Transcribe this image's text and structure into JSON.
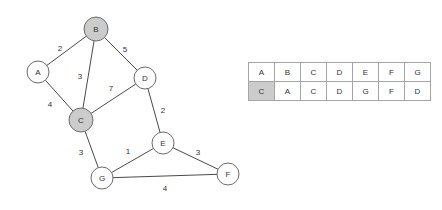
{
  "diagram": {
    "type": "weighted-undirected-graph",
    "nodes": [
      {
        "id": "A",
        "label": "A",
        "x": 38,
        "y": 72,
        "r": 11,
        "state": "plain"
      },
      {
        "id": "B",
        "label": "B",
        "x": 96,
        "y": 29,
        "r": 12,
        "state": "visited"
      },
      {
        "id": "C",
        "label": "C",
        "x": 81,
        "y": 120,
        "r": 12,
        "state": "visited"
      },
      {
        "id": "D",
        "label": "D",
        "x": 145,
        "y": 78,
        "r": 11,
        "state": "plain"
      },
      {
        "id": "E",
        "label": "E",
        "x": 163,
        "y": 143,
        "r": 11,
        "state": "plain"
      },
      {
        "id": "F",
        "label": "F",
        "x": 228,
        "y": 174,
        "r": 11,
        "state": "plain"
      },
      {
        "id": "G",
        "label": "G",
        "x": 102,
        "y": 178,
        "r": 11,
        "state": "plain"
      }
    ],
    "edges": [
      {
        "from": "A",
        "to": "B",
        "weight": "2",
        "lx": 60,
        "ly": 48
      },
      {
        "from": "B",
        "to": "D",
        "weight": "5",
        "lx": 125,
        "ly": 49
      },
      {
        "from": "B",
        "to": "C",
        "weight": "3",
        "lx": 80,
        "ly": 76
      },
      {
        "from": "A",
        "to": "C",
        "weight": "4",
        "lx": 50,
        "ly": 104
      },
      {
        "from": "C",
        "to": "D",
        "weight": "7",
        "lx": 111,
        "ly": 88
      },
      {
        "from": "D",
        "to": "E",
        "weight": "2",
        "lx": 163,
        "ly": 110
      },
      {
        "from": "C",
        "to": "G",
        "weight": "3",
        "lx": 81,
        "ly": 152
      },
      {
        "from": "G",
        "to": "E",
        "weight": "1",
        "lx": 128,
        "ly": 151
      },
      {
        "from": "E",
        "to": "F",
        "weight": "3",
        "lx": 198,
        "ly": 152
      },
      {
        "from": "G",
        "to": "F",
        "weight": "4",
        "lx": 165,
        "ly": 188
      }
    ]
  },
  "table": {
    "header_row": [
      "A",
      "B",
      "C",
      "D",
      "E",
      "F",
      "G"
    ],
    "value_row": [
      "C",
      "A",
      "C",
      "D",
      "G",
      "F",
      "D"
    ],
    "highlighted_value_index": 0
  },
  "colors": {
    "node_fill_plain": "#ffffff",
    "node_fill_visited": "#cccccc",
    "node_stroke": "#6b6b6b",
    "edge_stroke": "#4a4a4a",
    "text": "#333333",
    "table_border": "#a6a6a6",
    "table_highlight": "#cccccc",
    "background": "#ffffff"
  }
}
